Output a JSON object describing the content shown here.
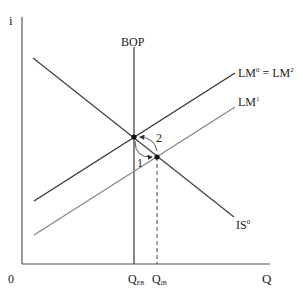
{
  "diagram": {
    "type": "IS-LM-BOP",
    "axes": {
      "y_label": "i",
      "x_label": "Q",
      "origin_label": "0"
    },
    "curves": {
      "bop": {
        "label": "BOP"
      },
      "is": {
        "label": "IS",
        "sup": "0"
      },
      "lm0": {
        "label": "LM",
        "sup": "0",
        "eq": " = LM",
        "sup2": "2"
      },
      "lm1": {
        "label": "LM",
        "sup": "1"
      }
    },
    "ticks": {
      "qeb": {
        "label": "Q",
        "sub": "EB"
      },
      "qib": {
        "label": "Q",
        "sub": "IB"
      }
    },
    "arrows": {
      "a1": {
        "label": "1"
      },
      "a2": {
        "label": "2"
      }
    },
    "colors": {
      "dark": "#333333",
      "light": "#777777"
    }
  }
}
